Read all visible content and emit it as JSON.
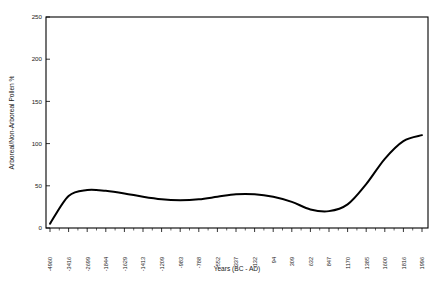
{
  "chart_data": {
    "type": "line",
    "title": "",
    "xlabel": "Years (BC - AD)",
    "ylabel": "Arboreal/Non-Arboreal Pollen %",
    "grid": false,
    "legend": null,
    "ylim": [
      0,
      250
    ],
    "yticks": [
      0,
      50,
      100,
      150,
      200,
      250
    ],
    "ytick_labels": [
      "0",
      "50",
      "100",
      "150",
      "200",
      "250"
    ],
    "xtick_labels": [
      "-4960",
      "-3416",
      "-2699",
      "-1844",
      "-1629",
      "-1413",
      "-1209",
      "-983",
      "-788",
      "-552",
      "-337",
      "-132",
      "94",
      "309",
      "632",
      "847",
      "1170",
      "1385",
      "1600",
      "1816",
      "1996"
    ],
    "x": [
      -4960,
      -3416,
      -2699,
      -1844,
      -1629,
      -1413,
      -1209,
      -983,
      -788,
      -552,
      -337,
      -132,
      94,
      309,
      632,
      847,
      1170,
      1385,
      1600,
      1816,
      1996
    ],
    "values": [
      5,
      38,
      45,
      44,
      41,
      37,
      34,
      33,
      34,
      37,
      40,
      40,
      37,
      31,
      22,
      20,
      28,
      52,
      82,
      103,
      110
    ],
    "series_name": "Arboreal/Non-Arboreal Pollen %",
    "line_color": "#000000",
    "annotations": []
  }
}
